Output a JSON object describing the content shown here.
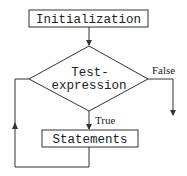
{
  "diagram": {
    "type": "flowchart",
    "nodes": [
      {
        "id": "init",
        "shape": "rectangle",
        "label": "Initialization"
      },
      {
        "id": "test",
        "shape": "diamond",
        "label_line1": "Test-",
        "label_line2": "expression"
      },
      {
        "id": "stmts",
        "shape": "rectangle",
        "label": "Statements"
      }
    ],
    "edges": [
      {
        "from": "init",
        "to": "test",
        "label": ""
      },
      {
        "from": "test",
        "to": "stmts",
        "label": "True"
      },
      {
        "from": "test",
        "to": "exit",
        "label": "False"
      },
      {
        "from": "stmts",
        "to": "test",
        "label": ""
      }
    ],
    "labels": {
      "init": "Initialization",
      "test_line1": "Test-",
      "test_line2": "expression",
      "stmts": "Statements",
      "true": "True",
      "false": "False"
    },
    "colors": {
      "stroke": "#333333",
      "background": "#ffffff"
    }
  }
}
